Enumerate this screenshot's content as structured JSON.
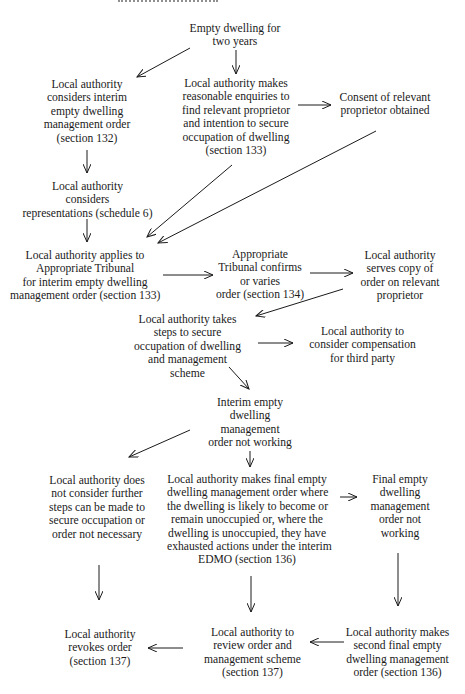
{
  "diagram": {
    "nodes": [
      {
        "id": "empty-two-years",
        "lines": [
          "Empty dwelling for",
          "two years"
        ]
      },
      {
        "id": "consider-interim-edmo",
        "lines": [
          "Local authority",
          "considers interim",
          "empty dwelling",
          "management order",
          "(section 132)"
        ]
      },
      {
        "id": "reasonable-enquiries",
        "lines": [
          "Local authority makes",
          "reasonable enquiries to",
          "find relevant proprietor",
          "and intention to secure",
          "occupation of dwelling",
          "(section 133)"
        ]
      },
      {
        "id": "consent-obtained",
        "lines": [
          "Consent of relevant",
          "proprietor obtained"
        ]
      },
      {
        "id": "considers-representations",
        "lines": [
          "Local authority",
          "considers",
          "representations (schedule 6)"
        ]
      },
      {
        "id": "applies-tribunal",
        "lines": [
          "Local authority applies to",
          "Appropriate Tribunal",
          "for interim empty dwelling",
          "management order (section 133)"
        ]
      },
      {
        "id": "tribunal-confirms",
        "lines": [
          "Appropriate",
          "Tribunal confirms",
          "or varies",
          "order (section 134)"
        ]
      },
      {
        "id": "serves-copy",
        "lines": [
          "Local authority",
          "serves copy of",
          "order on relevant",
          "proprietor"
        ]
      },
      {
        "id": "secure-occupation",
        "lines": [
          "Local authority takes",
          "steps to secure",
          "occupation of dwelling",
          "and management",
          "scheme"
        ]
      },
      {
        "id": "compensation",
        "lines": [
          "Local authority to",
          "consider compensation",
          "for third party"
        ]
      },
      {
        "id": "interim-not-working",
        "lines": [
          "Interim empty",
          "dwelling",
          "management",
          "order not working"
        ]
      },
      {
        "id": "no-further-steps",
        "lines": [
          "Local authority does",
          "not consider further",
          "steps can be made to",
          "secure occupation or",
          "order not necessary"
        ]
      },
      {
        "id": "final-edmo",
        "lines": [
          "Local authority makes final empty",
          "dwelling management order where",
          "the dwelling is likely to become or",
          "remain unoccupied or, where the",
          "dwelling is unoccupied, they have",
          "exhausted actions under the interim",
          "EDMO (section 136)"
        ]
      },
      {
        "id": "final-not-working",
        "lines": [
          "Final empty",
          "dwelling",
          "management",
          "order not",
          "working"
        ]
      },
      {
        "id": "revokes-order",
        "lines": [
          "Local authority",
          "revokes order",
          "(section 137)"
        ]
      },
      {
        "id": "review-order",
        "lines": [
          "Local authority to",
          "review order and",
          "management scheme",
          "(section 137)"
        ]
      },
      {
        "id": "second-final-edmo",
        "lines": [
          "Local authority makes",
          "second final empty",
          "dwelling management",
          "order (section 136)"
        ]
      }
    ],
    "edges": [
      {
        "from": "empty-two-years",
        "to": "consider-interim-edmo"
      },
      {
        "from": "empty-two-years",
        "to": "reasonable-enquiries"
      },
      {
        "from": "reasonable-enquiries",
        "to": "consent-obtained"
      },
      {
        "from": "consider-interim-edmo",
        "to": "considers-representations"
      },
      {
        "from": "reasonable-enquiries",
        "to": "applies-tribunal"
      },
      {
        "from": "consent-obtained",
        "to": "applies-tribunal"
      },
      {
        "from": "considers-representations",
        "to": "applies-tribunal"
      },
      {
        "from": "applies-tribunal",
        "to": "tribunal-confirms"
      },
      {
        "from": "tribunal-confirms",
        "to": "serves-copy"
      },
      {
        "from": "serves-copy",
        "to": "secure-occupation"
      },
      {
        "from": "secure-occupation",
        "to": "compensation"
      },
      {
        "from": "secure-occupation",
        "to": "interim-not-working"
      },
      {
        "from": "interim-not-working",
        "to": "no-further-steps"
      },
      {
        "from": "interim-not-working",
        "to": "final-edmo"
      },
      {
        "from": "final-edmo",
        "to": "final-not-working"
      },
      {
        "from": "no-further-steps",
        "to": "revokes-order"
      },
      {
        "from": "final-edmo",
        "to": "review-order"
      },
      {
        "from": "final-not-working",
        "to": "second-final-edmo"
      },
      {
        "from": "second-final-edmo",
        "to": "review-order"
      },
      {
        "from": "review-order",
        "to": "revokes-order"
      }
    ]
  }
}
